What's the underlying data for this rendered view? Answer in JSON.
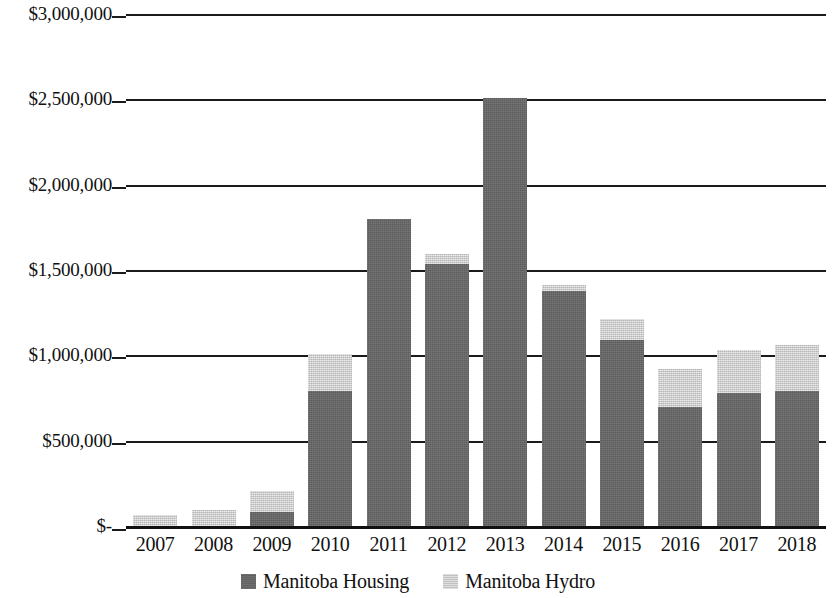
{
  "chart_data": {
    "type": "bar",
    "subtype": "stacked-vertical",
    "title": "",
    "xlabel": "",
    "ylabel": "",
    "categories": [
      "2007",
      "2008",
      "2009",
      "2010",
      "2011",
      "2012",
      "2013",
      "2014",
      "2015",
      "2016",
      "2017",
      "2018"
    ],
    "series": [
      {
        "name": "Manitoba Housing",
        "color": "#666666",
        "values": [
          0,
          0,
          85000,
          790000,
          1800000,
          1535000,
          2510000,
          1375000,
          1090000,
          695000,
          780000,
          790000
        ]
      },
      {
        "name": "Manitoba Hydro",
        "color": "#cfcfcf",
        "values": [
          65000,
          95000,
          120000,
          220000,
          0,
          60000,
          0,
          35000,
          125000,
          225000,
          250000,
          270000
        ]
      }
    ],
    "totals": [
      65000,
      95000,
      205000,
      1010000,
      1800000,
      1595000,
      2510000,
      1410000,
      1215000,
      920000,
      1030000,
      1060000
    ],
    "ylim": [
      0,
      3000000
    ],
    "y_ticks": [
      3000000,
      2500000,
      2000000,
      1500000,
      1000000,
      500000,
      0
    ],
    "y_tick_labels": [
      "$3,000,000",
      "$2,500,000",
      "$2,000,000",
      "$1,500,000",
      "$1,000,000",
      "$500,000",
      "$-"
    ],
    "grid": true,
    "grid_axis": "y",
    "legend_position": "bottom",
    "legend": [
      "Manitoba Housing",
      "Manitoba Hydro"
    ],
    "value_prefix": "$"
  },
  "axes": {
    "y": {
      "ticks": [
        {
          "label": "$3,000,000",
          "value": 3000000
        },
        {
          "label": "$2,500,000",
          "value": 2500000
        },
        {
          "label": "$2,000,000",
          "value": 2000000
        },
        {
          "label": "$1,500,000",
          "value": 1500000
        },
        {
          "label": "$1,000,000",
          "value": 1000000
        },
        {
          "label": "$500,000",
          "value": 500000
        },
        {
          "label": "$-",
          "value": 0
        }
      ]
    },
    "x": {
      "ticks": [
        "2007",
        "2008",
        "2009",
        "2010",
        "2011",
        "2012",
        "2013",
        "2014",
        "2015",
        "2016",
        "2017",
        "2018"
      ]
    }
  },
  "legend": {
    "items": [
      {
        "label": "Manitoba Housing",
        "swatch": "housing"
      },
      {
        "label": "Manitoba Hydro",
        "swatch": "hydro"
      }
    ]
  }
}
